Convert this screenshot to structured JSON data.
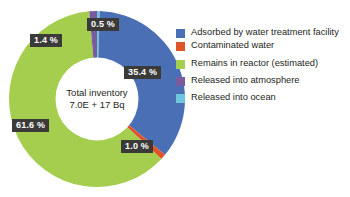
{
  "chart_data": {
    "type": "pie",
    "title": "",
    "subtitle": "",
    "xlabel": "",
    "ylabel": "",
    "legend_position": "right",
    "donut": true,
    "center_label_line1": "Total inventory",
    "center_label_line2": "7.0E + 17 Bq",
    "categories": [
      "Released into ocean",
      "Adsorbed by water treatment facility",
      "Contaminated water",
      "Remains in reactor (estimated)",
      "Released into atmosphere"
    ],
    "values": [
      0.5,
      35.4,
      1.0,
      61.6,
      1.4
    ],
    "value_labels": [
      "0.5 %",
      "35.4 %",
      "1.0 %",
      "61.6 %",
      "1.4 %"
    ],
    "colors": [
      "#6ec5dd",
      "#4a6fb5",
      "#e0542a",
      "#a5cd4e",
      "#7a5c9e"
    ],
    "slices": [
      {
        "name": "Released into ocean",
        "value": 0.5,
        "label": "0.5 %",
        "color": "#6ec5dd"
      },
      {
        "name": "Adsorbed by water treatment facility",
        "value": 35.4,
        "label": "35.4 %",
        "color": "#4a6fb5"
      },
      {
        "name": "Contaminated water",
        "value": 1.0,
        "label": "1.0 %",
        "color": "#e0542a"
      },
      {
        "name": "Remains in reactor (estimated)",
        "value": 61.6,
        "label": "61.6 %",
        "color": "#a5cd4e"
      },
      {
        "name": "Released into atmosphere",
        "value": 1.4,
        "label": "1.4 %",
        "color": "#7a5c9e"
      }
    ]
  },
  "center": {
    "line1": "Total inventory",
    "line2": "7.0E + 17 Bq"
  },
  "labels": {
    "ocean": "0.5 %",
    "atmosphere": "1.4 %",
    "adsorbed": "35.4 %",
    "contaminated": "1.0 %",
    "remains": "61.6 %"
  },
  "legend": {
    "items": [
      {
        "label": "Adsorbed by water treatment facility",
        "color": "#4a6fb5"
      },
      {
        "label": "Contaminated water",
        "color": "#e0542a"
      },
      {
        "label": "Remains in reactor (estimated)",
        "color": "#a5cd4e"
      },
      {
        "label": "Released into atmosphere",
        "color": "#7a5c9e"
      },
      {
        "label": "Released into ocean",
        "color": "#6ec5dd"
      }
    ]
  }
}
